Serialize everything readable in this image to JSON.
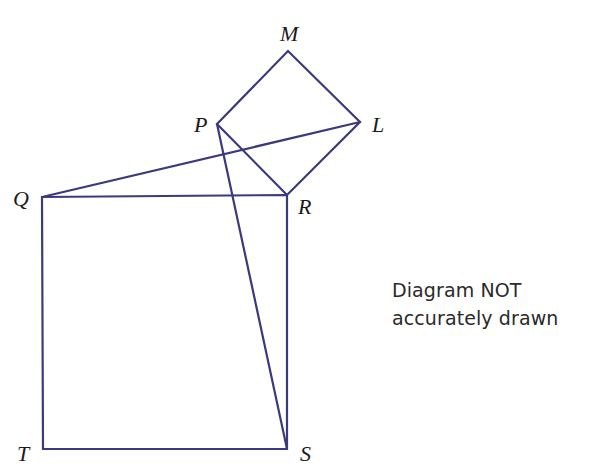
{
  "diagram": {
    "type": "geometry",
    "line_color": "#3a3a7c",
    "vertices": {
      "M": {
        "label": "M",
        "x": 288,
        "y": 51
      },
      "P": {
        "label": "P",
        "x": 217,
        "y": 124
      },
      "L": {
        "label": "L",
        "x": 360,
        "y": 122
      },
      "R": {
        "label": "R",
        "x": 287,
        "y": 195
      },
      "Q": {
        "label": "Q",
        "x": 42,
        "y": 197
      },
      "T": {
        "label": "T",
        "x": 43,
        "y": 449
      },
      "S": {
        "label": "S",
        "x": 287,
        "y": 449
      }
    },
    "shapes": [
      {
        "name": "square-QRST",
        "vertices": [
          "Q",
          "R",
          "S",
          "T"
        ]
      },
      {
        "name": "square-PMLR",
        "vertices": [
          "P",
          "M",
          "L",
          "R"
        ]
      }
    ],
    "segments": [
      {
        "name": "segment-QL",
        "from": "Q",
        "to": "L"
      },
      {
        "name": "segment-PS",
        "from": "P",
        "to": "S"
      }
    ],
    "labels": {
      "M": "M",
      "P": "P",
      "L": "L",
      "R": "R",
      "Q": "Q",
      "T": "T",
      "S": "S"
    },
    "note": {
      "line1": "Diagram NOT",
      "line2": "accurately drawn"
    }
  }
}
